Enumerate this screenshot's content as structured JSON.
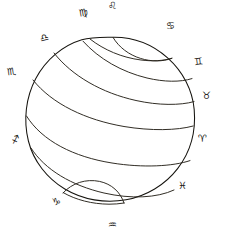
{
  "figure": {
    "ink_color": "#16140f",
    "background_color": "#ffffff",
    "style": "antique engraving line art"
  },
  "sphere": {
    "center_x": 112,
    "center_y": 121,
    "radius": 84,
    "outline_color": "#16140f"
  },
  "zodiac": {
    "count": 12,
    "signs": [
      {
        "name": "Leo",
        "glyph": "♌",
        "x": 113,
        "y": 6,
        "rotate": -6,
        "label": "Leo"
      },
      {
        "name": "Cancer",
        "glyph": "♋",
        "x": 171,
        "y": 26,
        "rotate": 0,
        "label": "Cancer"
      },
      {
        "name": "Gemini",
        "glyph": "♊",
        "x": 199,
        "y": 62,
        "rotate": -8,
        "label": "Gemini"
      },
      {
        "name": "Taurus",
        "glyph": "♉",
        "x": 207,
        "y": 96,
        "rotate": 0,
        "label": "Taurus"
      },
      {
        "name": "Aries",
        "glyph": "♈",
        "x": 203,
        "y": 139,
        "rotate": 0,
        "label": "Aries"
      },
      {
        "name": "Pisces",
        "glyph": "♓",
        "x": 183,
        "y": 186,
        "rotate": 0,
        "label": "Pisces"
      },
      {
        "name": "Aquarius",
        "glyph": "♒",
        "x": 113,
        "y": 225,
        "rotate": 0,
        "label": "Aquarius"
      },
      {
        "name": "Capricorn",
        "glyph": "♑",
        "x": 57,
        "y": 202,
        "rotate": -10,
        "label": "Capricorn"
      },
      {
        "name": "Sagittarius",
        "glyph": "♐",
        "x": 16,
        "y": 140,
        "rotate": -18,
        "label": "Sagittarius"
      },
      {
        "name": "Scorpio",
        "glyph": "♏",
        "x": 12,
        "y": 72,
        "rotate": -8,
        "label": "Scorpio"
      },
      {
        "name": "Libra",
        "glyph": "♎",
        "x": 45,
        "y": 38,
        "rotate": -14,
        "label": "Libra"
      },
      {
        "name": "Virgo",
        "glyph": "♍",
        "x": 84,
        "y": 13,
        "rotate": -10,
        "label": "Virgo"
      }
    ]
  },
  "arcs": {
    "description": "Parallel circles of declination drawn across the sphere face",
    "count": 8
  }
}
